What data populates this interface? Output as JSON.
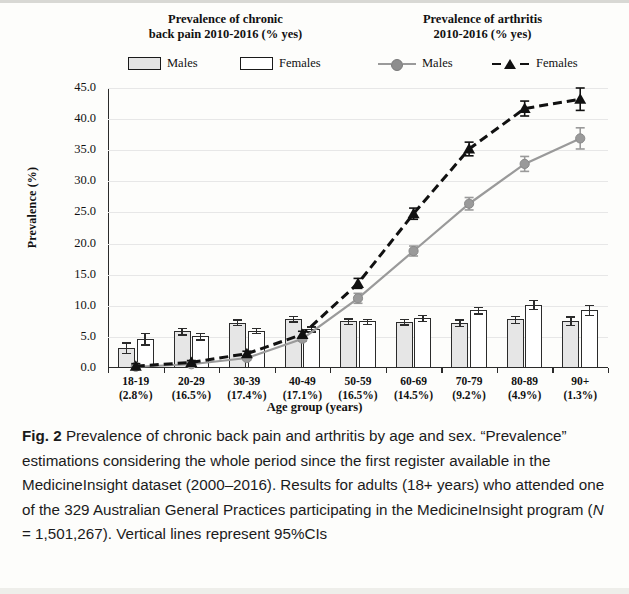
{
  "figure": {
    "panel_titles": {
      "left": "Prevalence of chronic\nback pain 2010-2016 (% yes)",
      "left_line1": "Prevalence of chronic",
      "left_line2": "back pain 2010-2016 (% yes)",
      "right_line1": "Prevalence of arthritis",
      "right_line2": "2010-2016 (% yes)"
    },
    "caption": {
      "label": "Fig. 2",
      "text": " Prevalence of chronic back pain and arthritis by age and sex. “Prevalence” estimations considering the whole period since the first register available in the MedicineInsight dataset (2000–2016). Results for adults (18+ years) who attended one of the 329 Australian General Practices participating in the MedicineInsight program (",
      "n_italic": "N",
      "n_value": " = 1,501,267).",
      "tail": " Vertical lines represent 95%CIs"
    }
  },
  "legend": {
    "items": [
      {
        "label": "Males",
        "marker": "bar-swatch-gray",
        "group": "back-pain"
      },
      {
        "label": "Females",
        "marker": "bar-swatch-white",
        "group": "back-pain"
      },
      {
        "label": "Males",
        "marker": "line-gray-circle",
        "group": "arthritis"
      },
      {
        "label": "Females",
        "marker": "line-black-dashed-triangle",
        "group": "arthritis"
      }
    ]
  },
  "colors": {
    "bar_males": "#e6e6e6",
    "bar_females": "#ffffff",
    "bar_outline": "#2b2b2b",
    "line_males": "#9a9a9a",
    "line_females": "#111111",
    "grid": "#e7e7e7",
    "axis": "#2b2b2b"
  },
  "chart_data": {
    "type": "bar",
    "title": "Prevalence of chronic back pain and arthritis by age and sex",
    "xlabel": "Age group (years)",
    "ylabel": "Prevalence (%)",
    "ylim": [
      0,
      45
    ],
    "yticks": [
      "0.0",
      "5.0",
      "10.0",
      "15.0",
      "20.0",
      "25.0",
      "30.0",
      "35.0",
      "40.0",
      "45.0"
    ],
    "ytick_values": [
      0,
      5,
      10,
      15,
      20,
      25,
      30,
      35,
      40,
      45
    ],
    "grid": true,
    "legend_position": "top",
    "categories": [
      "18-19\n(2.8%)",
      "20-29\n(16.5%)",
      "30-39\n(17.4%)",
      "40-49\n(17.1%)",
      "50-59\n(16.5%)",
      "60-69\n(14.5%)",
      "70-79\n(9.2%)",
      "80-89\n(4.9%)",
      "90+\n(1.3%)"
    ],
    "category_labels": [
      {
        "range": "18-19",
        "pct": "(2.8%)"
      },
      {
        "range": "20-29",
        "pct": "(16.5%)"
      },
      {
        "range": "30-39",
        "pct": "(17.4%)"
      },
      {
        "range": "40-49",
        "pct": "(17.1%)"
      },
      {
        "range": "50-59",
        "pct": "(16.5%)"
      },
      {
        "range": "60-69",
        "pct": "(14.5%)"
      },
      {
        "range": "70-79",
        "pct": "(9.2%)"
      },
      {
        "range": "80-89",
        "pct": "(4.9%)"
      },
      {
        "range": "90+",
        "pct": "(1.3%)"
      }
    ],
    "series": [
      {
        "name": "Males",
        "group": "Prevalence of chronic back pain 2010-2016 (% yes)",
        "render": "bar",
        "values": [
          3.2,
          5.9,
          7.3,
          7.9,
          7.5,
          7.4,
          7.3,
          7.8,
          7.6
        ],
        "err_low": [
          2.4,
          5.4,
          6.9,
          7.5,
          7.1,
          7.0,
          6.8,
          7.2,
          6.9
        ],
        "err_high": [
          4.1,
          6.5,
          7.8,
          8.4,
          8.0,
          7.9,
          7.8,
          8.4,
          8.3
        ]
      },
      {
        "name": "Females",
        "group": "Prevalence of chronic back pain 2010-2016 (% yes)",
        "render": "bar",
        "values": [
          4.7,
          5.1,
          6.0,
          6.3,
          7.5,
          8.0,
          9.3,
          10.2,
          9.3
        ],
        "err_low": [
          3.8,
          4.6,
          5.6,
          5.9,
          7.1,
          7.6,
          8.8,
          9.5,
          8.5
        ],
        "err_high": [
          5.6,
          5.6,
          6.4,
          6.7,
          7.9,
          8.5,
          9.8,
          10.9,
          10.1
        ]
      },
      {
        "name": "Males",
        "group": "Prevalence of arthritis 2010-2016 (% yes)",
        "render": "line",
        "style": "solid-gray-circle",
        "values": [
          0.2,
          0.6,
          1.6,
          4.7,
          11.2,
          18.8,
          26.4,
          32.8,
          36.9
        ],
        "err_low": [
          0.0,
          0.4,
          1.3,
          4.3,
          10.4,
          18.0,
          25.4,
          31.6,
          35.2
        ],
        "err_high": [
          0.6,
          0.9,
          1.9,
          5.1,
          12.0,
          19.6,
          27.4,
          34.0,
          38.6
        ]
      },
      {
        "name": "Females",
        "group": "Prevalence of arthritis 2010-2016 (% yes)",
        "render": "line",
        "style": "dashed-black-triangle",
        "values": [
          0.3,
          0.9,
          2.3,
          5.4,
          13.6,
          24.8,
          35.2,
          41.7,
          43.2
        ],
        "err_low": [
          0.0,
          0.6,
          2.0,
          5.0,
          12.8,
          23.9,
          34.1,
          40.5,
          41.4
        ],
        "err_high": [
          0.7,
          1.2,
          2.7,
          5.9,
          14.4,
          25.7,
          36.3,
          42.9,
          45.0
        ]
      }
    ]
  }
}
